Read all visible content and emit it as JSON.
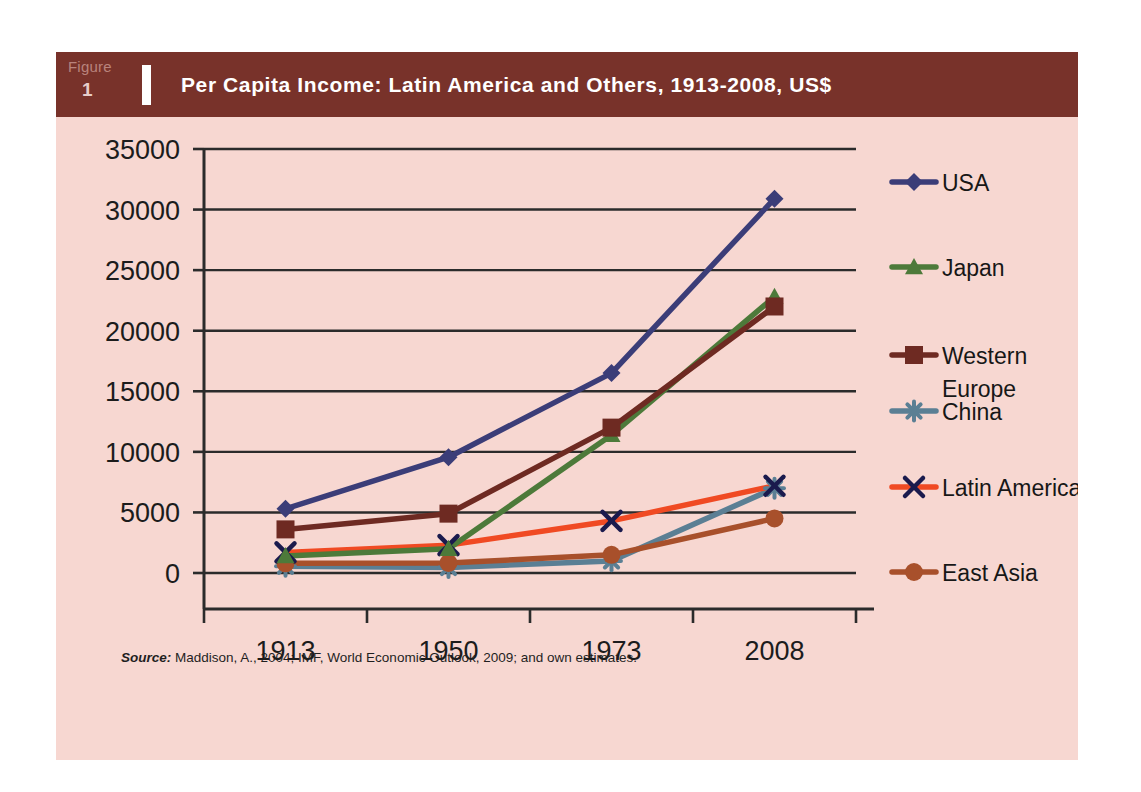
{
  "figure": {
    "tag_word": "Figure",
    "tag_number": "1",
    "title": "Per Capita Income: Latin America and Others, 1913-2008, US$",
    "header_color": "#78322a",
    "panel_color": "#f7d7d1",
    "source_prefix": "Source:",
    "source_text": " Maddison, A., 2004; IMF, World Economic Outlook, 2009; and own estimates."
  },
  "chart_data": {
    "type": "line",
    "title": "Per Capita Income: Latin America and Others, 1913-2008, US$",
    "xlabel": "",
    "ylabel": "",
    "categories": [
      "1913",
      "1950",
      "1973",
      "2008"
    ],
    "x": [
      1913,
      1950,
      1973,
      2008
    ],
    "ylim": [
      0,
      35000
    ],
    "ytick_values": [
      0,
      5000,
      10000,
      15000,
      20000,
      25000,
      30000,
      35000
    ],
    "ytick_labels": [
      "0",
      "5000",
      "10000",
      "15000",
      "20000",
      "25000",
      "30000",
      "35000"
    ],
    "xtick_labels": [
      "1913",
      "1950",
      "1973",
      "2008"
    ],
    "grid": true,
    "legend_position": "right",
    "series": [
      {
        "name": "USA",
        "color": "#3b3d78",
        "marker": "diamond",
        "values": [
          5300,
          9560,
          16500,
          30900
        ]
      },
      {
        "name": "Japan",
        "color": "#4d7a3a",
        "marker": "triangle",
        "values": [
          1400,
          2000,
          11400,
          22800
        ]
      },
      {
        "name": "Western Europe",
        "color": "#6e2a22",
        "marker": "square",
        "values": [
          3600,
          4900,
          12000,
          22000
        ]
      },
      {
        "name": "China",
        "color": "#5b7f94",
        "marker": "asterisk",
        "values": [
          550,
          450,
          1000,
          7000
        ]
      },
      {
        "name": "Latin America",
        "color": "#f04a23",
        "marker": "cross",
        "values": [
          1700,
          2300,
          4300,
          7200
        ]
      },
      {
        "name": "East Asia",
        "color": "#a8502b",
        "marker": "circle",
        "values": [
          800,
          830,
          1500,
          4500
        ]
      }
    ],
    "legend_entries": [
      {
        "label": "USA",
        "color": "#3b3d78",
        "marker": "diamond"
      },
      {
        "label": "Japan",
        "color": "#4d7a3a",
        "marker": "triangle"
      },
      {
        "label": "Western Europe",
        "color": "#6e2a22",
        "marker": "square"
      },
      {
        "label": "China",
        "color": "#5b7f94",
        "marker": "asterisk"
      },
      {
        "label": "Latin America",
        "color": "#f04a23",
        "marker": "cross"
      },
      {
        "label": "East Asia",
        "color": "#a8502b",
        "marker": "circle"
      }
    ]
  }
}
